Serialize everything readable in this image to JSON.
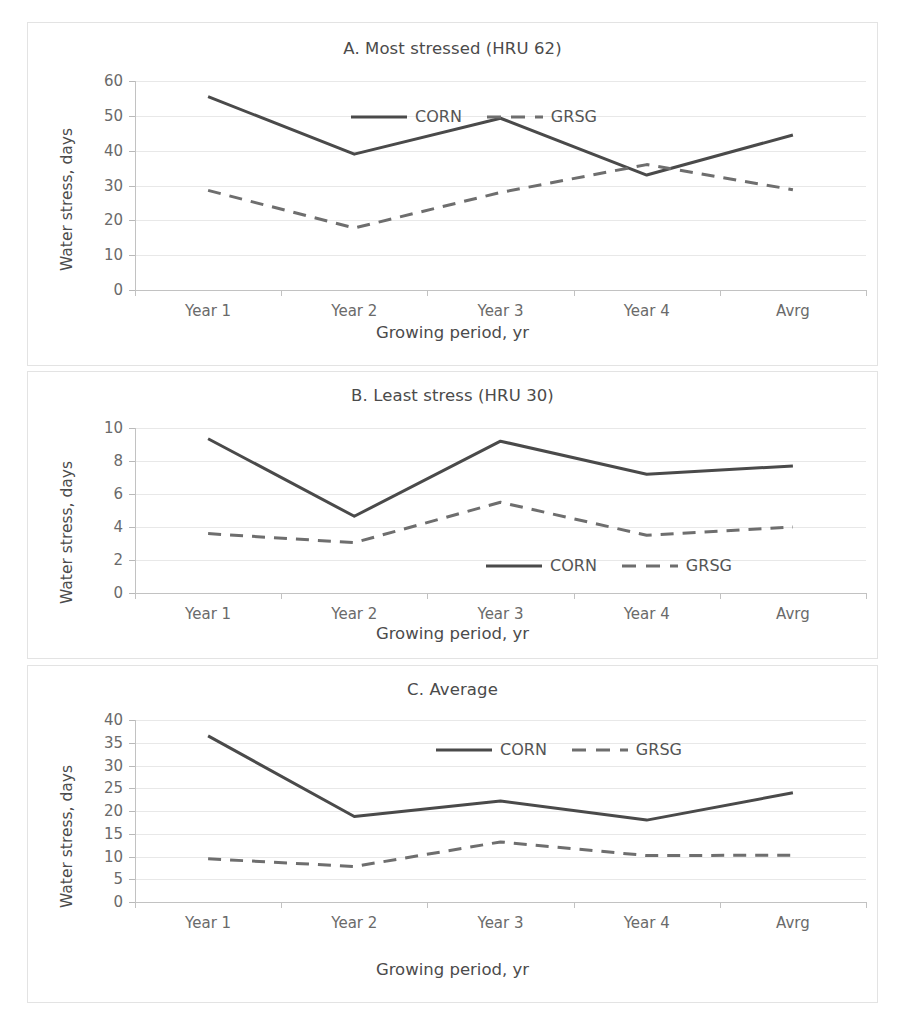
{
  "figure": {
    "series_names": [
      "CORN",
      "GRSG"
    ],
    "categories": [
      "Year 1",
      "Year 2",
      "Year 3",
      "Year 4",
      "Avrg"
    ],
    "xlabel": "Growing period, yr",
    "ylabel": "Water stress, days",
    "corn_color": "#4a4a4a",
    "grsg_color": "#6e6e6e"
  },
  "chart_data": [
    {
      "type": "line",
      "panel": "A",
      "title": "A. Most stressed (HRU 62)",
      "categories": [
        "Year 1",
        "Year 2",
        "Year 3",
        "Year 4",
        "Avrg"
      ],
      "series": [
        {
          "name": "CORN",
          "values": [
            55.5,
            39.0,
            49.3,
            33.0,
            44.5
          ],
          "style": "solid"
        },
        {
          "name": "GRSG",
          "values": [
            28.6,
            17.8,
            28.0,
            36.0,
            28.8
          ],
          "style": "dashed"
        }
      ],
      "xlabel": "Growing period, yr",
      "ylabel": "Water stress, days",
      "ylim": [
        0,
        60
      ],
      "ytick_step": 10,
      "yticks": [
        0,
        10,
        20,
        30,
        40,
        50,
        60
      ],
      "grid": true,
      "legend": "inside-top-center"
    },
    {
      "type": "line",
      "panel": "B",
      "title": "B. Least stress (HRU 30)",
      "categories": [
        "Year 1",
        "Year 2",
        "Year 3",
        "Year 4",
        "Avrg"
      ],
      "series": [
        {
          "name": "CORN",
          "values": [
            9.35,
            4.65,
            9.2,
            7.2,
            7.7
          ],
          "style": "solid"
        },
        {
          "name": "GRSG",
          "values": [
            3.6,
            3.05,
            5.5,
            3.5,
            4.0
          ],
          "style": "dashed"
        }
      ],
      "xlabel": "Growing period, yr",
      "ylabel": "Water stress, days",
      "ylim": [
        0,
        10
      ],
      "ytick_step": 2,
      "yticks": [
        0,
        2,
        4,
        6,
        8,
        10
      ],
      "grid": true,
      "legend": "inside-bottom-center"
    },
    {
      "type": "line",
      "panel": "C",
      "title": "C. Average",
      "categories": [
        "Year 1",
        "Year 2",
        "Year 3",
        "Year 4",
        "Avrg"
      ],
      "series": [
        {
          "name": "CORN",
          "values": [
            36.5,
            18.8,
            22.2,
            18.0,
            24.0
          ],
          "style": "solid"
        },
        {
          "name": "GRSG",
          "values": [
            9.5,
            7.8,
            13.2,
            10.2,
            10.3
          ],
          "style": "dashed"
        }
      ],
      "xlabel": "Growing period, yr",
      "ylabel": "Water stress, days",
      "ylim": [
        0,
        40
      ],
      "ytick_step": 5,
      "yticks": [
        0,
        5,
        10,
        15,
        20,
        25,
        30,
        35,
        40
      ],
      "grid": true,
      "legend": "inside-top-center"
    }
  ]
}
